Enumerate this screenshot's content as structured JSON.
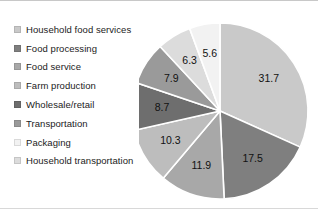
{
  "chart_data": {
    "type": "pie",
    "title": "",
    "subtitle": "",
    "xlabel": "",
    "ylabel": "",
    "legend_position": "left",
    "grid": false,
    "start_angle_deg": 0,
    "direction": "clockwise",
    "total": 100.0,
    "units": "percent",
    "categories": [
      "Household food services",
      "Food processing",
      "Food service",
      "Farm production",
      "Wholesale/retail",
      "Transportation",
      "Packaging",
      "Household transportation"
    ],
    "values": [
      31.7,
      17.5,
      11.9,
      10.3,
      8.7,
      7.9,
      5.6,
      6.3
    ],
    "data_labels": [
      "31.7",
      "17.5",
      "11.9",
      "10.3",
      "8.7",
      "7.9",
      "5.6",
      "6.3"
    ],
    "colors": [
      "#c9c9c9",
      "#7f7f7f",
      "#a8a8a8",
      "#bdbdbd",
      "#6e6e6e",
      "#9a9a9a",
      "#f2f2f2",
      "#dcdcdc"
    ],
    "slice_order_clockwise_from_top": [
      "Household food services",
      "Food processing",
      "Food service",
      "Farm production",
      "Wholesale/retail",
      "Transportation",
      "Household transportation",
      "Packaging"
    ]
  },
  "legend": {
    "items": [
      {
        "label": "Household food services",
        "color": "#c9c9c9",
        "value": 31.7
      },
      {
        "label": "Food processing",
        "color": "#7f7f7f",
        "value": 17.5
      },
      {
        "label": "Food service",
        "color": "#a8a8a8",
        "value": 11.9
      },
      {
        "label": "Farm production",
        "color": "#bdbdbd",
        "value": 10.3
      },
      {
        "label": "Wholesale/retail",
        "color": "#6e6e6e",
        "value": 8.7
      },
      {
        "label": "Transportation",
        "color": "#9a9a9a",
        "value": 7.9
      },
      {
        "label": "Packaging",
        "color": "#f2f2f2",
        "value": 5.6
      },
      {
        "label": "Household transportation",
        "color": "#dcdcdc",
        "value": 6.3
      }
    ]
  },
  "pie": {
    "center_x": 81,
    "center_y": 103,
    "radius": 88,
    "label_radius_factor": 0.66,
    "separator_color": "#ffffff",
    "separator_width": 1.6
  }
}
